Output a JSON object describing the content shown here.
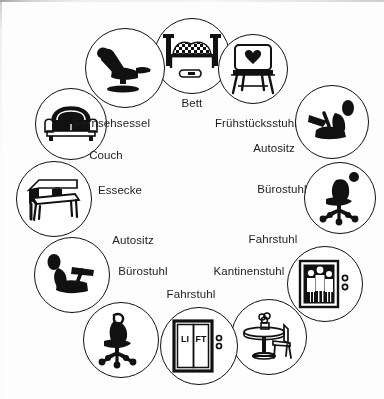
{
  "diagram": {
    "type": "radial-icon-circle",
    "background_color": "#fdfdfb",
    "ink_color": "#111111",
    "node_count": 12,
    "nodes": [
      {
        "id": "bett",
        "label": "Bett",
        "icon": "bed-icon",
        "position": "top-center",
        "cx": 192,
        "cy": 56,
        "r": 38,
        "label_x": 192,
        "label_y": 104
      },
      {
        "id": "fruehstuecksstuhl",
        "label": "Frühstücksstuhl",
        "icon": "heart-back-chair-icon",
        "position": "top-right",
        "cx": 253,
        "cy": 69,
        "r": 35,
        "label_x": 255,
        "label_y": 124
      },
      {
        "id": "autositz-rechts",
        "label": "Autositz",
        "icon": "car-seat-icon",
        "position": "upper-right",
        "cx": 332,
        "cy": 122,
        "r": 37,
        "label_x": 272,
        "label_y": 149
      },
      {
        "id": "buerostuhl-rechts",
        "label": "Bürostuhl",
        "icon": "office-chair-icon",
        "position": "right",
        "cx": 340,
        "cy": 198,
        "r": 36,
        "label_x": 279,
        "label_y": 190
      },
      {
        "id": "fahrstuhl-rechts",
        "label": "Fahrstuhl",
        "icon": "elevator-people-icon",
        "position": "lower-right",
        "cx": 325,
        "cy": 284,
        "r": 38,
        "label_x": 272,
        "label_y": 240
      },
      {
        "id": "kantinenstuhl",
        "label": "Kantinenstuhl",
        "icon": "cafe-table-chair-icon",
        "position": "bottom-right",
        "cx": 269,
        "cy": 337,
        "r": 38,
        "label_x": 249,
        "label_y": 272
      },
      {
        "id": "fahrstuhl-unten",
        "label": "Fahrstuhl",
        "icon": "elevator-doors-icon",
        "position": "bottom-center",
        "cx": 199,
        "cy": 346,
        "r": 39,
        "label_x": 186,
        "label_y": 295
      },
      {
        "id": "buerostuhl-links",
        "label": "Bürostuhl",
        "icon": "office-chair-icon",
        "position": "bottom-left",
        "cx": 121,
        "cy": 340,
        "r": 38,
        "label_x": 141,
        "label_y": 272
      },
      {
        "id": "autositz-links",
        "label": "Autositz",
        "icon": "car-seat-icon",
        "position": "lower-left",
        "cx": 72,
        "cy": 275,
        "r": 38,
        "label_x": 131,
        "label_y": 241
      },
      {
        "id": "essecke",
        "label": "Essecke",
        "icon": "dining-bench-icon",
        "position": "left",
        "cx": 54,
        "cy": 199,
        "r": 38,
        "label_x": 112,
        "label_y": 191
      },
      {
        "id": "couch",
        "label": "Couch",
        "icon": "couch-icon",
        "position": "upper-left",
        "cx": 71,
        "cy": 124,
        "r": 36,
        "label_x": 104,
        "label_y": 156
      },
      {
        "id": "fernsehsessel",
        "label": "Fernsehsessel",
        "icon": "recliner-icon",
        "position": "top-left",
        "cx": 125,
        "cy": 68,
        "r": 40,
        "label_x": 111,
        "label_y": 124
      }
    ]
  }
}
